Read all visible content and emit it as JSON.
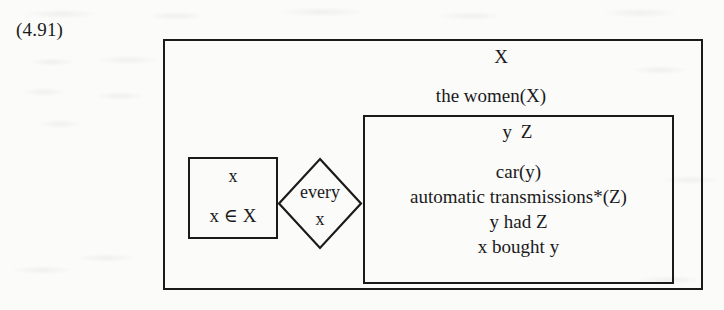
{
  "equation": {
    "number": "(4.91)"
  },
  "outer_box": {
    "universe": "X",
    "condition": "the women(X)"
  },
  "restrictor_box": {
    "universe": "x",
    "condition": "x ∈ X"
  },
  "quantifier": {
    "label": "every",
    "variable": "x",
    "shape": "diamond"
  },
  "scope_box": {
    "universe": "y  Z",
    "conditions": [
      "car(y)",
      "automatic transmissions*(Z)",
      "y had Z",
      "x bought y"
    ]
  },
  "style": {
    "ink": "#1a1a1a",
    "paper": "#fbfbfa"
  }
}
